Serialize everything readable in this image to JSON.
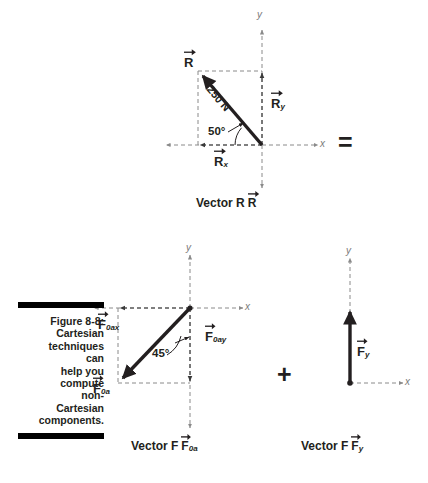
{
  "figure": {
    "caption_label": "Figure 8-8:",
    "caption_lines": [
      "Cartesian",
      "techniques",
      "can",
      "help you",
      "compute",
      "non-",
      "Cartesian",
      "components."
    ],
    "ink_color": "#231f20",
    "axis_color": "#8a8a8a",
    "dash_color": "#8a8a8a"
  },
  "operators": {
    "equals": "=",
    "plus": "+"
  },
  "diagram_r": {
    "caption": "Vector R",
    "caption_symbol": "R",
    "axis_x_label": "x",
    "axis_y_label": "y",
    "vector_label": "R",
    "magnitude_label": "250 N",
    "angle_label": "50°",
    "component_y_label": "R",
    "component_y_sub": "y",
    "component_x_label": "R",
    "component_x_sub": "x"
  },
  "diagram_f0a": {
    "caption": "Vector F",
    "caption_symbol": "F",
    "caption_sub": "0a",
    "axis_x_label": "x",
    "axis_y_label": "y",
    "vector_label": "F",
    "vector_sub": "0a",
    "angle_label": "45°",
    "component_x_label": "F",
    "component_x_sub": "0ax",
    "component_y_label": "F",
    "component_y_sub": "0ay"
  },
  "diagram_fy": {
    "caption": "Vector F",
    "caption_symbol": "F",
    "caption_sub": "y",
    "axis_x_label": "x",
    "axis_y_label": "y",
    "vector_label": "F",
    "vector_sub": "y"
  }
}
